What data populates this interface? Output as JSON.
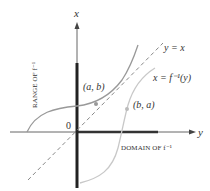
{
  "axes": {
    "vertical_label": "x",
    "horizontal_label": "y",
    "origin_label": "0"
  },
  "labels": {
    "range": "RANGE OF f⁻¹",
    "domain": "DOMAIN OF f⁻¹",
    "point_ab": "(a, b)",
    "point_ba": "(b, a)",
    "line_eq": "y = x",
    "inverse_eq": "x = f⁻¹(y)"
  },
  "colors": {
    "axis": "#555555",
    "thick_axis": "#222222",
    "curve_f": "#999999",
    "curve_inverse": "#c8c8c8",
    "dashed": "#888888"
  }
}
